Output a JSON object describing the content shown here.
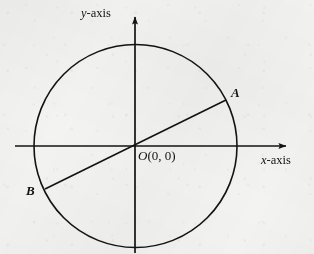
{
  "figure": {
    "background_color": "#f3f3f2",
    "stroke_color": "#131313"
  },
  "axes": {
    "x": {
      "label_variable": "x",
      "label_suffix": "-axis",
      "label_full": "x-axis",
      "y_position": 146,
      "start_x": 15,
      "end_x": 290,
      "arrow": "right"
    },
    "y": {
      "label_variable": "y",
      "label_suffix": "-axis",
      "label_full": "y-axis",
      "x_position": 135,
      "start_y": 253,
      "end_y": 12,
      "arrow": "up"
    }
  },
  "circle": {
    "center_x": 135.5,
    "center_y": 146,
    "radius": 101.5,
    "stroke_width": 1.6
  },
  "origin": {
    "label": "O(0, 0)",
    "variable": "O",
    "coordinates": "(0, 0)",
    "x": 135,
    "y": 146
  },
  "points": [
    {
      "label": "A",
      "x": 226,
      "y": 100,
      "quadrant": 1
    },
    {
      "label": "B",
      "x": 45,
      "y": 189,
      "quadrant": 3
    }
  ],
  "segments": [
    {
      "name": "diameter-ab",
      "from": "B",
      "to": "A",
      "x1": 45,
      "y1": 189,
      "x2": 226,
      "y2": 100,
      "stroke_width": 1.6
    }
  ],
  "chart_data": {
    "type": "scatter",
    "xlabel": "x-axis",
    "ylabel": "y-axis",
    "grid": false,
    "legend": null,
    "shapes": [
      {
        "kind": "circle",
        "center": [
          0,
          0
        ],
        "radius": 1
      },
      {
        "kind": "line",
        "points": [
          [
            -0.89,
            -0.42
          ],
          [
            0.89,
            0.42
          ]
        ],
        "label": "AB"
      }
    ],
    "annotations": [
      {
        "text": "A",
        "at": [
          0.89,
          0.42
        ]
      },
      {
        "text": "B",
        "at": [
          -0.89,
          -0.42
        ]
      },
      {
        "text": "O(0, 0)",
        "at": [
          0,
          0
        ]
      }
    ]
  }
}
